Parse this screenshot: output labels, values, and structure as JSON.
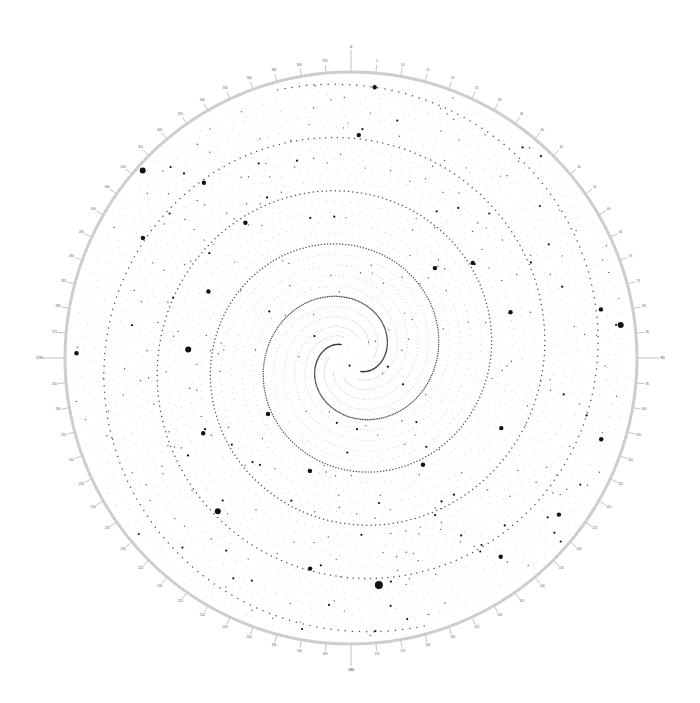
{
  "chart_data": {
    "type": "scatter",
    "coordinate_system": "polar",
    "title": "",
    "angular_axis": {
      "unit": "degrees",
      "range": [
        0,
        360
      ],
      "direction": "clockwise",
      "zero_at": "top",
      "major_tick_step": 5,
      "minor_tick_step": 1,
      "cardinal_labels": [
        "0",
        "90",
        "180",
        "270"
      ],
      "tick_labels": [
        "0",
        "5",
        "10",
        "15",
        "20",
        "25",
        "30",
        "35",
        "40",
        "45",
        "50",
        "55",
        "60",
        "65",
        "70",
        "75",
        "80",
        "85",
        "90",
        "95",
        "100",
        "105",
        "110",
        "115",
        "120",
        "125",
        "130",
        "135",
        "140",
        "145",
        "150",
        "155",
        "160",
        "165",
        "170",
        "175",
        "180",
        "185",
        "190",
        "195",
        "200",
        "205",
        "210",
        "215",
        "220",
        "225",
        "230",
        "235",
        "240",
        "245",
        "250",
        "255",
        "260",
        "265",
        "270",
        "275",
        "280",
        "285",
        "290",
        "295",
        "300",
        "305",
        "310",
        "315",
        "320",
        "325",
        "330",
        "335",
        "340",
        "345",
        "350",
        "355"
      ]
    },
    "radial_axis": {
      "range": [
        0,
        1
      ],
      "visible": false
    },
    "spiral_field": {
      "description": "dense field of small dots arranged along curved spiral arms, two prominent arms emanating from the center",
      "arms": 2,
      "turns": 2.6,
      "field_points": 5200,
      "golden_angle_deg": 137.508
    },
    "highlighted_points": [
      {
        "theta": 5,
        "r": 0.95,
        "size": 2
      },
      {
        "theta": 2,
        "r": 0.78,
        "size": 2
      },
      {
        "theta": 312,
        "r": 0.98,
        "size": 3
      },
      {
        "theta": 300,
        "r": 0.84,
        "size": 2
      },
      {
        "theta": 322,
        "r": 0.6,
        "size": 2
      },
      {
        "theta": 295,
        "r": 0.55,
        "size": 2
      },
      {
        "theta": 273,
        "r": 0.57,
        "size": 3
      },
      {
        "theta": 271,
        "r": 0.96,
        "size": 2
      },
      {
        "theta": 243,
        "r": 0.58,
        "size": 2
      },
      {
        "theta": 221,
        "r": 0.71,
        "size": 3
      },
      {
        "theta": 191,
        "r": 0.75,
        "size": 2
      },
      {
        "theta": 173,
        "r": 0.8,
        "size": 4
      },
      {
        "theta": 143,
        "r": 0.87,
        "size": 2
      },
      {
        "theta": 127,
        "r": 0.91,
        "size": 2
      },
      {
        "theta": 108,
        "r": 0.92,
        "size": 2
      },
      {
        "theta": 83,
        "r": 0.95,
        "size": 3
      },
      {
        "theta": 79,
        "r": 0.89,
        "size": 2
      },
      {
        "theta": 74,
        "r": 0.58,
        "size": 2
      },
      {
        "theta": 52,
        "r": 0.54,
        "size": 2
      },
      {
        "theta": 43,
        "r": 0.43,
        "size": 2
      },
      {
        "theta": 320,
        "r": 0.8,
        "size": 2
      },
      {
        "theta": 236,
        "r": 0.35,
        "size": 2
      },
      {
        "theta": 146,
        "r": 0.45,
        "size": 2
      },
      {
        "theta": 115,
        "r": 0.58,
        "size": 2
      },
      {
        "theta": 200,
        "r": 0.42,
        "size": 2
      }
    ],
    "colors": {
      "ring": "#cfcfcf",
      "tick": "#999999",
      "dot": "#111111",
      "faint_dot": "#9a9a9a",
      "background": "#ffffff"
    }
  }
}
